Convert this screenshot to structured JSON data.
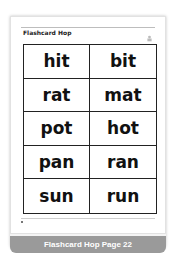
{
  "thumbnail": {
    "page_title": "Flashcard Hop",
    "logo_icon": "mascot-icon",
    "grid": {
      "rows": [
        [
          "hit",
          "bit"
        ],
        [
          "rat",
          "mat"
        ],
        [
          "pot",
          "hot"
        ],
        [
          "pan",
          "ran"
        ],
        [
          "sun",
          "run"
        ]
      ]
    },
    "footer": {
      "left": "",
      "center": "",
      "right": ""
    },
    "caption": "Flashcard Hop Page 22"
  },
  "colors": {
    "banner": "#9a9a9a",
    "grid_lines": "#222222",
    "text": "#111111"
  }
}
